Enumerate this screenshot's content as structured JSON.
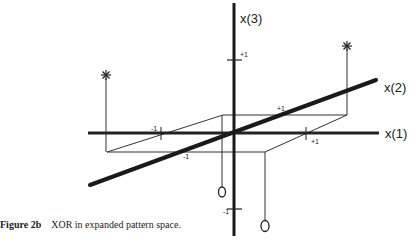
{
  "figure": {
    "caption_label": "Figure 2b",
    "caption_text": "XOR in expanded pattern space.",
    "axes": {
      "x1": {
        "label": "x(1)",
        "neg_tick": "-1",
        "pos_tick": "+1"
      },
      "x2": {
        "label": "x(2)",
        "neg_tick": "-1",
        "pos_tick": "+1"
      },
      "x3": {
        "label": "x(3)",
        "neg_tick": "-1",
        "pos_tick": "+1"
      }
    },
    "points": [
      {
        "marker": "*",
        "class": "star",
        "position": "left-back"
      },
      {
        "marker": "*",
        "class": "star",
        "position": "right-back"
      },
      {
        "marker": "O",
        "class": "circle",
        "position": "center-back"
      },
      {
        "marker": "O",
        "class": "circle",
        "position": "right-front"
      }
    ],
    "colors": {
      "ink": "#222222",
      "background": "#ffffff"
    }
  }
}
